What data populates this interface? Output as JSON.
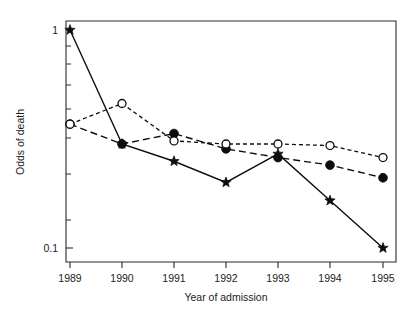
{
  "chart_data": {
    "type": "line",
    "title": "",
    "subtitle": "",
    "xlabel": "Year of admission",
    "ylabel": "Odds of death",
    "x": [
      1989,
      1990,
      1991,
      1992,
      1993,
      1994,
      1995
    ],
    "categories": [
      "1989",
      "1990",
      "1991",
      "1992",
      "1993",
      "1994",
      "1995"
    ],
    "xtick_labels": [
      "1989",
      "1990",
      "1991",
      "1992",
      "1993",
      "1994",
      "1995"
    ],
    "ytick_labels": [
      "1",
      "0.1"
    ],
    "ytick_values": [
      1,
      0.1
    ],
    "yscale": "log",
    "ylim": [
      0.09,
      1.12
    ],
    "xlim": [
      1988.7,
      1995.25
    ],
    "grid": false,
    "legend": "none",
    "series": [
      {
        "name": "star-series",
        "marker": "star",
        "linestyle": "solid",
        "color": "#0d0d0d",
        "values": [
          1.0,
          0.3,
          0.25,
          0.2,
          0.27,
          0.165,
          0.1
        ]
      },
      {
        "name": "filled-circle-series",
        "marker": "filled-circle",
        "linestyle": "dashed",
        "color": "#0d0d0d",
        "values": [
          0.37,
          0.3,
          0.335,
          0.285,
          0.26,
          0.24,
          0.21
        ]
      },
      {
        "name": "open-circle-series",
        "marker": "open-circle",
        "linestyle": "dotted",
        "color": "#0d0d0d",
        "values": [
          0.37,
          0.46,
          0.31,
          0.3,
          0.3,
          0.295,
          0.26
        ]
      }
    ],
    "annotations": []
  },
  "axes": {
    "y_title": "Odds of death",
    "x_title": "Year of admission",
    "y_labels": [
      "1",
      "0.1"
    ],
    "x_labels": [
      "1989",
      "1990",
      "1991",
      "1992",
      "1993",
      "1994",
      "1995"
    ]
  },
  "colors": {
    "ink": "#0d0d0d",
    "frame": "#2b2b2b",
    "background": "#ffffff",
    "marker_fill_open": "#ffffff"
  }
}
